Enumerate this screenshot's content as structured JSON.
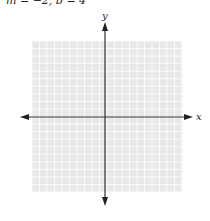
{
  "header": {
    "cropped_text": "m = −2, b = 4"
  },
  "graph": {
    "x_label": "x",
    "y_label": "y",
    "grid": {
      "left": 32,
      "top": 41,
      "right": 182,
      "bottom": 192,
      "cells_x": 20,
      "cells_y": 20,
      "fill_color": "#e8e8e8",
      "line_color": "#ffffff"
    },
    "x_axis": {
      "y": 117,
      "x_start": 20,
      "x_end": 193
    },
    "y_axis": {
      "x": 105,
      "y_start": 22,
      "y_end": 206
    },
    "axis_color": "#333333"
  }
}
